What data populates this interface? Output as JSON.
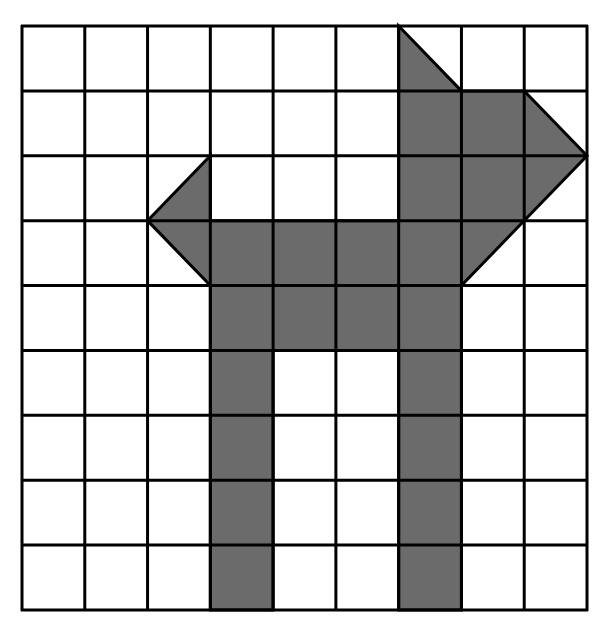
{
  "diagram": {
    "type": "grid-shape",
    "grid": {
      "columns": 9,
      "rows": 9,
      "left": 22,
      "top": 26,
      "right": 587,
      "bottom": 610,
      "line_color": "#000000",
      "line_width": 3,
      "background": "#ffffff"
    },
    "shape": {
      "fill": "#6b6b6b",
      "stroke": "#000000",
      "description": "Shaded polygon on a 9x9 grid resembling an animal/dog figure with two legs",
      "vertices_grid_units": [
        [
          6,
          0
        ],
        [
          7,
          1
        ],
        [
          8,
          1
        ],
        [
          9,
          2
        ],
        [
          7,
          4
        ],
        [
          7,
          9
        ],
        [
          6,
          9
        ],
        [
          6,
          5
        ],
        [
          4,
          5
        ],
        [
          4,
          9
        ],
        [
          3,
          9
        ],
        [
          3,
          4
        ],
        [
          2,
          3
        ],
        [
          3,
          2
        ],
        [
          3,
          3
        ],
        [
          6,
          3
        ]
      ],
      "full_cells": [
        [
          6,
          1
        ],
        [
          7,
          1
        ],
        [
          6,
          2
        ],
        [
          7,
          2
        ],
        [
          3,
          3
        ],
        [
          4,
          3
        ],
        [
          5,
          3
        ],
        [
          6,
          3
        ],
        [
          3,
          4
        ],
        [
          4,
          4
        ],
        [
          5,
          4
        ],
        [
          6,
          4
        ],
        [
          3,
          5
        ],
        [
          6,
          5
        ],
        [
          3,
          6
        ],
        [
          6,
          6
        ],
        [
          3,
          7
        ],
        [
          6,
          7
        ],
        [
          3,
          8
        ],
        [
          6,
          8
        ]
      ],
      "half_cells": [
        {
          "cell": [
            6,
            0
          ],
          "triangle": [
            [
              6,
              0
            ],
            [
              7,
              1
            ],
            [
              6,
              1
            ]
          ]
        },
        {
          "cell": [
            8,
            1
          ],
          "triangle": [
            [
              8,
              1
            ],
            [
              9,
              2
            ],
            [
              8,
              2
            ]
          ]
        },
        {
          "cell": [
            8,
            2
          ],
          "triangle": [
            [
              8,
              2
            ],
            [
              9,
              2
            ],
            [
              8,
              3
            ]
          ]
        },
        {
          "cell": [
            7,
            3
          ],
          "triangle": [
            [
              7,
              3
            ],
            [
              8,
              3
            ],
            [
              7,
              4
            ]
          ]
        },
        {
          "cell": [
            2,
            2
          ],
          "triangle": [
            [
              3,
              2
            ],
            [
              3,
              3
            ],
            [
              2,
              3
            ]
          ]
        },
        {
          "cell": [
            2,
            3
          ],
          "triangle": [
            [
              2,
              3
            ],
            [
              3,
              3
            ],
            [
              3,
              4
            ]
          ]
        }
      ],
      "area_square_units": 23
    }
  }
}
